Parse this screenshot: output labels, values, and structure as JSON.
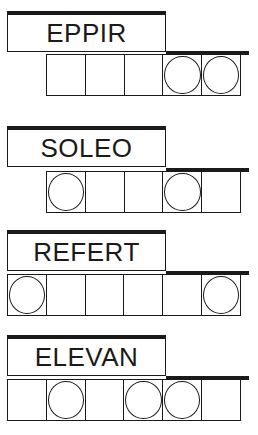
{
  "puzzles": [
    {
      "scrambled": "EPPIR",
      "cells": 5,
      "circled": [
        4,
        5
      ]
    },
    {
      "scrambled": "SOLEO",
      "cells": 5,
      "circled": [
        1,
        4
      ]
    },
    {
      "scrambled": "REFERT",
      "cells": 6,
      "circled": [
        1,
        6
      ]
    },
    {
      "scrambled": "ELEVAN",
      "cells": 6,
      "circled": [
        2,
        4,
        5
      ]
    }
  ]
}
